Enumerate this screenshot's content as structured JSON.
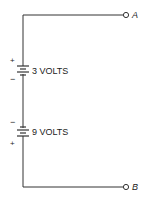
{
  "diagram": {
    "type": "circuit",
    "terminals": [
      {
        "id": "A",
        "label": "A"
      },
      {
        "id": "B",
        "label": "B"
      }
    ],
    "batteries": [
      {
        "label": "3 VOLTS",
        "top_polarity": "+",
        "bottom_polarity": "−"
      },
      {
        "label": "9 VOLTS",
        "top_polarity": "−",
        "bottom_polarity": "+"
      }
    ],
    "colors": {
      "line": "#333333",
      "text": "#222222"
    }
  }
}
